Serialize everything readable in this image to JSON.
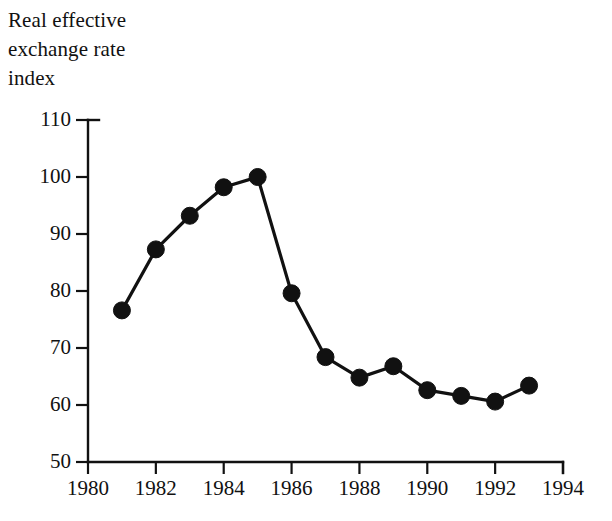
{
  "chart_data": {
    "type": "line",
    "title": "Real effective\nexchange rate\nindex",
    "xlabel": "",
    "ylabel": "",
    "x": [
      1981,
      1982,
      1983,
      1984,
      1985,
      1986,
      1987,
      1988,
      1989,
      1990,
      1991,
      1992,
      1993
    ],
    "values": [
      76.6,
      87.3,
      93.2,
      98.2,
      100.0,
      79.6,
      68.4,
      64.8,
      66.8,
      62.6,
      61.6,
      60.6,
      63.4
    ],
    "series": [
      {
        "name": "Real effective exchange rate index",
        "values": [
          76.6,
          87.3,
          93.2,
          98.2,
          100.0,
          79.6,
          68.4,
          64.8,
          66.8,
          62.6,
          61.6,
          60.6,
          63.4
        ]
      }
    ],
    "xlim": [
      1980,
      1994
    ],
    "ylim": [
      50,
      110
    ],
    "x_ticks": [
      1980,
      1982,
      1984,
      1986,
      1988,
      1990,
      1992,
      1994
    ],
    "x_tick_labels": [
      "1980",
      "1982",
      "1984",
      "1986",
      "1988",
      "1990",
      "1992",
      "1994"
    ],
    "y_ticks": [
      50,
      60,
      70,
      80,
      90,
      100,
      110
    ],
    "y_tick_labels": [
      "50",
      "60",
      "70",
      "80",
      "90",
      "100",
      "110"
    ],
    "grid": false,
    "legend": "none",
    "marker": "filled-circle",
    "line_color": "#111111",
    "marker_color": "#111111",
    "background_color": "#ffffff"
  }
}
